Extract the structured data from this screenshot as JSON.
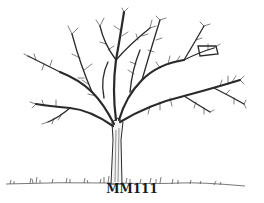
{
  "figure": {
    "caption": "MM111",
    "colors": {
      "ink": "#2a2a2a",
      "background": "#ffffff",
      "grass": "#555555"
    }
  }
}
